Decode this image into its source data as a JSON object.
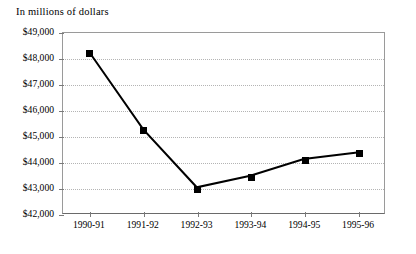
{
  "chart_data": {
    "type": "line",
    "title": "In millions of dollars",
    "xlabel": "",
    "ylabel": "",
    "categories": [
      "1990-91",
      "1991-92",
      "1992-93",
      "1993-94",
      "1994-95",
      "1995-96"
    ],
    "values": [
      48230,
      45250,
      43000,
      43450,
      44100,
      44350
    ],
    "series": [
      {
        "name": "Amount",
        "values": [
          48230,
          45250,
          43000,
          43450,
          44100,
          44350
        ]
      }
    ],
    "ylim": [
      42000,
      49000
    ],
    "ytick_values": [
      42000,
      43000,
      44000,
      45000,
      46000,
      47000,
      48000,
      49000
    ],
    "ytick_labels": [
      "$42,000",
      "$43,000",
      "$44,000",
      "$45,000",
      "$46,000",
      "$47,000",
      "$48,000",
      "$49,000"
    ],
    "grid": true,
    "grid_orientation": "horizontal",
    "grid_style": "dotted",
    "legend": false,
    "legend_position": "none",
    "marker": "square",
    "marker_color": "#000000",
    "line_color": "#000000",
    "line_width": 2,
    "plot_background": "#ffffff",
    "frame_color": "#9a9a9a"
  }
}
